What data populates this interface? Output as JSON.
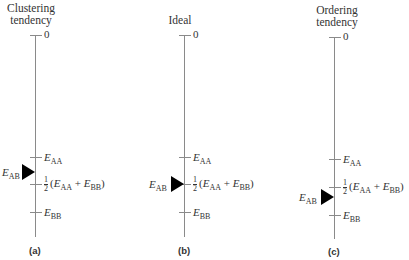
{
  "figure": {
    "panels": [
      {
        "id": "a",
        "title_line1": "Clustering",
        "title_line2": "tendency",
        "caption": "(a)",
        "zero_label": "0",
        "e_aa_label": "E",
        "e_aa_sub": "AA",
        "mid_num": "1",
        "mid_den": "2",
        "mid_text_open": "(",
        "mid_e1": "E",
        "mid_e1_sub": "AA",
        "mid_plus": " + ",
        "mid_e2": "E",
        "mid_e2_sub": "BB",
        "mid_text_close": ")",
        "e_bb_label": "E",
        "e_bb_sub": "BB",
        "e_ab_label": "E",
        "e_ab_sub": "AB",
        "e_ab_position": "between E_AA and ½(E_AA + E_BB)"
      },
      {
        "id": "b",
        "title_line1": "Ideal",
        "title_line2": "",
        "caption": "(b)",
        "zero_label": "0",
        "e_aa_label": "E",
        "e_aa_sub": "AA",
        "mid_num": "1",
        "mid_den": "2",
        "mid_text_open": "(",
        "mid_e1": "E",
        "mid_e1_sub": "AA",
        "mid_plus": " + ",
        "mid_e2": "E",
        "mid_e2_sub": "BB",
        "mid_text_close": ")",
        "e_bb_label": "E",
        "e_bb_sub": "BB",
        "e_ab_label": "E",
        "e_ab_sub": "AB",
        "e_ab_position": "at ½(E_AA + E_BB)"
      },
      {
        "id": "c",
        "title_line1": "Ordering",
        "title_line2": "tendency",
        "caption": "(c)",
        "zero_label": "0",
        "e_aa_label": "E",
        "e_aa_sub": "AA",
        "mid_num": "1",
        "mid_den": "2",
        "mid_text_open": "(",
        "mid_e1": "E",
        "mid_e1_sub": "AA",
        "mid_plus": " + ",
        "mid_e2": "E",
        "mid_e2_sub": "BB",
        "mid_text_close": ")",
        "e_bb_label": "E",
        "e_bb_sub": "BB",
        "e_ab_label": "E",
        "e_ab_sub": "AB",
        "e_ab_position": "between ½(E_AA + E_BB) and E_BB"
      }
    ],
    "colors": {
      "axis": "#8a8a8a",
      "arrow": "#000000",
      "text": "#333333"
    }
  }
}
